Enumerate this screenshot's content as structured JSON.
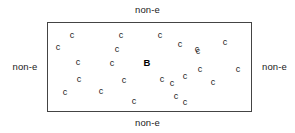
{
  "diagram": {
    "box": {
      "x": 47,
      "y": 22,
      "width": 205,
      "height": 90,
      "border_color": "#444444",
      "fill_color": "#ffffff"
    },
    "edge_labels": {
      "top": "non-e",
      "bottom": "non-e",
      "left": "non-e",
      "right": "non-e"
    },
    "bacterium": {
      "label": "B",
      "x": 147,
      "y": 63
    },
    "particles": [
      {
        "label": "c",
        "x": 72,
        "y": 35
      },
      {
        "label": "c",
        "x": 58,
        "y": 47
      },
      {
        "label": "c",
        "x": 78,
        "y": 62
      },
      {
        "label": "c",
        "x": 79,
        "y": 79
      },
      {
        "label": "c",
        "x": 65,
        "y": 92
      },
      {
        "label": "c",
        "x": 121,
        "y": 35
      },
      {
        "label": "c",
        "x": 117,
        "y": 49
      },
      {
        "label": "c",
        "x": 112,
        "y": 63
      },
      {
        "label": "c",
        "x": 124,
        "y": 80
      },
      {
        "label": "c",
        "x": 101,
        "y": 91
      },
      {
        "label": "c",
        "x": 134,
        "y": 101
      },
      {
        "label": "c",
        "x": 160,
        "y": 35
      },
      {
        "label": "c",
        "x": 180,
        "y": 44
      },
      {
        "label": "c",
        "x": 197,
        "y": 49
      },
      {
        "label": "c",
        "x": 225,
        "y": 42
      },
      {
        "label": "c",
        "x": 162,
        "y": 79
      },
      {
        "label": "c",
        "x": 172,
        "y": 83
      },
      {
        "label": "c",
        "x": 185,
        "y": 76
      },
      {
        "label": "c",
        "x": 200,
        "y": 69
      },
      {
        "label": "c",
        "x": 213,
        "y": 82
      },
      {
        "label": "c",
        "x": 198,
        "y": 51
      },
      {
        "label": "c",
        "x": 238,
        "y": 69
      },
      {
        "label": "c",
        "x": 176,
        "y": 96
      },
      {
        "label": "c",
        "x": 185,
        "y": 102
      }
    ]
  }
}
